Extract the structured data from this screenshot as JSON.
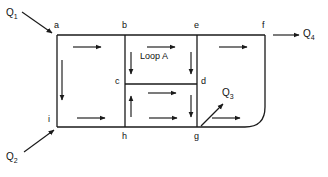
{
  "diagram": {
    "type": "pipe-network-loop",
    "loop_label": "Loop A",
    "nodes": [
      {
        "id": "a",
        "label": "a",
        "x": 56,
        "y": 30
      },
      {
        "id": "b",
        "label": "b",
        "x": 124,
        "y": 30
      },
      {
        "id": "e",
        "label": "e",
        "x": 196,
        "y": 30
      },
      {
        "id": "f",
        "label": "f",
        "x": 264,
        "y": 30
      },
      {
        "id": "c",
        "label": "c",
        "x": 124,
        "y": 84
      },
      {
        "id": "d",
        "label": "d",
        "x": 196,
        "y": 84
      },
      {
        "id": "i",
        "label": "i",
        "x": 56,
        "y": 127
      },
      {
        "id": "h",
        "label": "h",
        "x": 124,
        "y": 127
      },
      {
        "id": "g",
        "label": "g",
        "x": 196,
        "y": 127
      }
    ],
    "pipes": [
      {
        "name": "a-b",
        "from": "a",
        "to": "b",
        "direction": "right"
      },
      {
        "name": "b-e",
        "from": "b",
        "to": "e",
        "direction": "right"
      },
      {
        "name": "e-f",
        "from": "e",
        "to": "f",
        "direction": "right"
      },
      {
        "name": "a-i",
        "from": "a",
        "to": "i",
        "direction": "down"
      },
      {
        "name": "b-c",
        "from": "b",
        "to": "c",
        "direction": "down"
      },
      {
        "name": "e-d",
        "from": "e",
        "to": "d",
        "direction": "down"
      },
      {
        "name": "c-d",
        "from": "c",
        "to": "d",
        "direction": "right"
      },
      {
        "name": "h-c",
        "from": "h",
        "to": "c",
        "direction": "up"
      },
      {
        "name": "d-g",
        "from": "d",
        "to": "g",
        "direction": "down"
      },
      {
        "name": "i-h",
        "from": "i",
        "to": "h",
        "direction": "right"
      },
      {
        "name": "h-g",
        "from": "h",
        "to": "g",
        "direction": "right"
      },
      {
        "name": "g-f",
        "from": "g",
        "to": "f",
        "direction": "right-curved"
      }
    ],
    "flows": [
      {
        "id": "Q1",
        "base": "Q",
        "sub": "1",
        "label": "Q₁",
        "kind": "inflow",
        "at_node": "a",
        "label_x": 6,
        "label_y": 10
      },
      {
        "id": "Q2",
        "base": "Q",
        "sub": "2",
        "label": "Q₂",
        "kind": "inflow",
        "at_node": "i",
        "label_x": 6,
        "label_y": 155
      },
      {
        "id": "Q3",
        "base": "Q",
        "sub": "3",
        "label": "Q₃",
        "kind": "outflow",
        "at_node": "g",
        "label_x": 222,
        "label_y": 90
      },
      {
        "id": "Q4",
        "base": "Q",
        "sub": "4",
        "label": "Q₄",
        "kind": "outflow",
        "at_node": "f",
        "label_x": 305,
        "label_y": 33
      }
    ],
    "colors": {
      "line": "#1a1a1a",
      "text": "#111111",
      "background": "#ffffff"
    }
  }
}
